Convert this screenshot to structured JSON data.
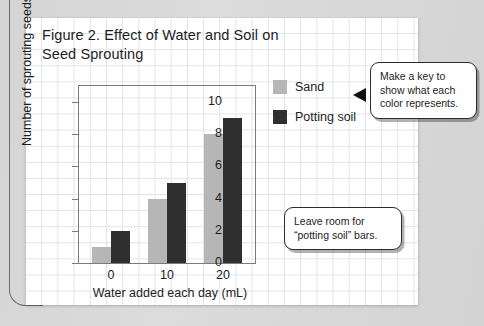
{
  "figure": {
    "title": "Figure 2. Effect of Water and Soil on Seed Sprouting"
  },
  "legend": {
    "items": [
      {
        "label": "Sand",
        "color": "#b6b6b6"
      },
      {
        "label": "Potting soil",
        "color": "#2f2f2f"
      }
    ]
  },
  "callouts": [
    {
      "id": "key",
      "text": "Make a key to show what each color represents."
    },
    {
      "id": "room",
      "text": "Leave room for “potting soil” bars."
    }
  ],
  "chart_data": {
    "type": "bar",
    "title": "Figure 2. Effect of Water and Soil on Seed Sprouting",
    "xlabel": "Water added each day (mL)",
    "ylabel": "Number of sprouting seeds",
    "categories": [
      "0",
      "10",
      "20"
    ],
    "series": [
      {
        "name": "Sand",
        "color": "#b6b6b6",
        "values": [
          1,
          4,
          8
        ]
      },
      {
        "name": "Potting soil",
        "color": "#2f2f2f",
        "values": [
          2,
          5,
          9
        ]
      }
    ],
    "ylim": [
      0,
      11
    ],
    "yticks": [
      0,
      2,
      4,
      6,
      8,
      10
    ],
    "xticks": [
      "0",
      "10",
      "20"
    ],
    "grid": false,
    "legend_position": "right"
  }
}
